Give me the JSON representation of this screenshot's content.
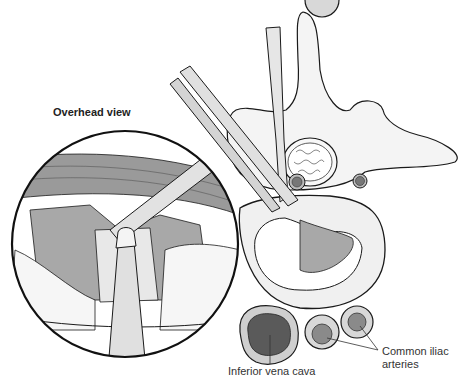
{
  "figure": {
    "type": "medical-illustration",
    "inset_title": "Overhead view",
    "labels": {
      "ivc": "Inferior vena cava",
      "iliac_line1": "Common iliac",
      "iliac_line2": "arteries"
    },
    "colors": {
      "outline": "#1a1a1a",
      "bone": "#f4f4f4",
      "vessel_dark": "#5a5a5a",
      "vessel_mid": "#8a8a8a",
      "vessel_ring": "#d8d8d8",
      "instrument": "#e0e0e0",
      "muscle": "#9a9a9a",
      "cavity": "#a8a8a8"
    }
  }
}
